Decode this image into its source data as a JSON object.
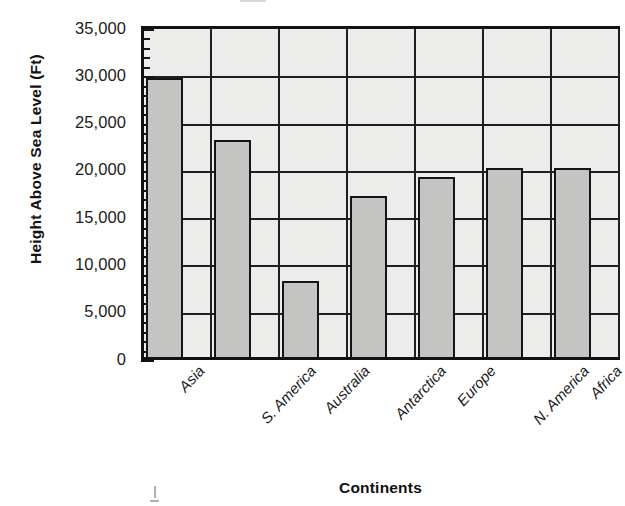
{
  "chart_data": {
    "type": "bar",
    "title": "",
    "xlabel": "Continents",
    "ylabel": "Height Above Sea Level (Ft)",
    "categories": [
      "Asia",
      "S. America",
      "Australia",
      "Antarctica",
      "Europe",
      "N. America",
      "Africa"
    ],
    "values": [
      29500,
      23000,
      8000,
      17000,
      19000,
      20000,
      20000
    ],
    "ylim": [
      0,
      35000
    ],
    "ytick_labels": [
      "0",
      "5,000",
      "10,000",
      "15,000",
      "20,000",
      "25,000",
      "30,000",
      "35,000"
    ],
    "ytick_values": [
      0,
      5000,
      10000,
      15000,
      20000,
      25000,
      30000,
      35000
    ],
    "minor_tick_interval": 1000,
    "major_tick_interval": 5000,
    "grid": true,
    "grid_axis": "y",
    "legend": "none",
    "bar_fill_color": "#c4c4c2",
    "bar_border_color": "#141414",
    "plot_background_color": "#ececeb",
    "axis_color": "#111111",
    "series": [
      {
        "name": "Highest Point",
        "values": [
          29500,
          23000,
          8000,
          17000,
          19000,
          20000,
          20000
        ]
      }
    ]
  },
  "axes": {
    "y_title": "Height Above Sea Level (Ft)",
    "x_title": "Continents"
  }
}
